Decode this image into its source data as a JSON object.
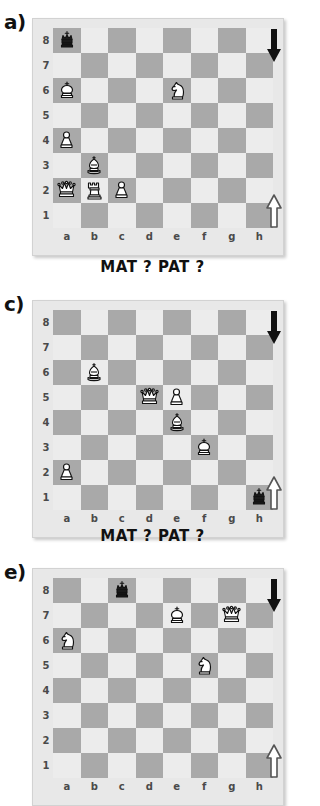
{
  "document": {
    "title": "Chess exercises: MAT ? PAT ?",
    "caption_text": "MAT ?   PAT ?",
    "files": [
      "a",
      "b",
      "c",
      "d",
      "e",
      "f",
      "g",
      "h"
    ],
    "ranks": [
      "8",
      "7",
      "6",
      "5",
      "4",
      "3",
      "2",
      "1"
    ],
    "colors": {
      "light_square": "#ececec",
      "dark_square": "#a9a9a9",
      "board_frame": "#e8e8e8",
      "page_background": "#ffffff",
      "label_text": "#4a4a4a",
      "heading_text": "#111111",
      "black_piece": "#1a1a1a",
      "white_piece": "#ffffff"
    }
  },
  "panels": [
    {
      "id": "panel-a",
      "label": "a)",
      "turn_top_icon": "arrow-down-black-icon",
      "turn_bottom_icon": "arrow-up-white-icon",
      "pieces": [
        {
          "square": "a8",
          "color": "black",
          "type": "king",
          "glyph": "black-king-icon"
        },
        {
          "square": "a6",
          "color": "white",
          "type": "king",
          "glyph": "white-king-icon"
        },
        {
          "square": "e6",
          "color": "white",
          "type": "knight",
          "glyph": "white-knight-icon"
        },
        {
          "square": "a4",
          "color": "white",
          "type": "pawn",
          "glyph": "white-pawn-icon"
        },
        {
          "square": "b3",
          "color": "white",
          "type": "bishop",
          "glyph": "white-bishop-icon"
        },
        {
          "square": "a2",
          "color": "white",
          "type": "queen",
          "glyph": "white-queen-icon"
        },
        {
          "square": "b2",
          "color": "white",
          "type": "rook",
          "glyph": "white-rook-icon"
        },
        {
          "square": "c2",
          "color": "white",
          "type": "pawn",
          "glyph": "white-pawn-icon"
        }
      ]
    },
    {
      "id": "panel-c",
      "label": "c)",
      "turn_top_icon": "arrow-down-black-icon",
      "turn_bottom_icon": "arrow-up-white-icon",
      "pieces": [
        {
          "square": "b6",
          "color": "white",
          "type": "bishop",
          "glyph": "white-bishop-icon"
        },
        {
          "square": "d5",
          "color": "white",
          "type": "queen",
          "glyph": "white-queen-icon"
        },
        {
          "square": "e5",
          "color": "white",
          "type": "pawn",
          "glyph": "white-pawn-icon"
        },
        {
          "square": "e4",
          "color": "white",
          "type": "bishop",
          "glyph": "white-bishop-icon"
        },
        {
          "square": "f3",
          "color": "white",
          "type": "king",
          "glyph": "white-king-icon"
        },
        {
          "square": "a2",
          "color": "white",
          "type": "pawn",
          "glyph": "white-pawn-icon"
        },
        {
          "square": "h1",
          "color": "black",
          "type": "king",
          "glyph": "black-king-icon"
        }
      ]
    },
    {
      "id": "panel-e",
      "label": "e)",
      "turn_top_icon": "arrow-down-black-icon",
      "turn_bottom_icon": "arrow-up-white-icon",
      "pieces": [
        {
          "square": "c8",
          "color": "black",
          "type": "king",
          "glyph": "black-king-icon"
        },
        {
          "square": "e7",
          "color": "white",
          "type": "king",
          "glyph": "white-king-icon"
        },
        {
          "square": "g7",
          "color": "white",
          "type": "queen",
          "glyph": "white-queen-icon"
        },
        {
          "square": "a6",
          "color": "white",
          "type": "knight",
          "glyph": "white-knight-icon"
        },
        {
          "square": "f5",
          "color": "white",
          "type": "knight",
          "glyph": "white-knight-icon"
        }
      ]
    }
  ],
  "captions": [
    {
      "id": "caption-1",
      "text": "MAT ?   PAT ?"
    },
    {
      "id": "caption-2",
      "text": "MAT ?   PAT ?"
    }
  ]
}
